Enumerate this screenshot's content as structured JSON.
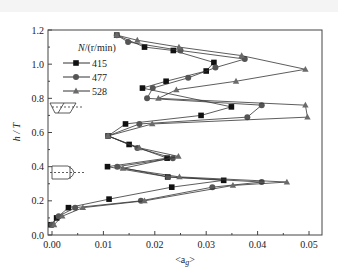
{
  "chart_data": {
    "type": "line",
    "title": "",
    "xlabel": "<a_g>",
    "ylabel": "h / T",
    "xlim": [
      0.0,
      0.0525
    ],
    "ylim": [
      0.0,
      1.2
    ],
    "xticks": [
      "0.00",
      "0.01",
      "0.02",
      "0.03",
      "0.04",
      "0.05"
    ],
    "yticks": [
      "0.0",
      "0.2",
      "0.4",
      "0.6",
      "0.8",
      "1.0",
      "1.2"
    ],
    "grid": false,
    "legend_title": "N/(r/min)",
    "legend_position": "upper left",
    "series": [
      {
        "name": "415",
        "marker": "square",
        "points": [
          [
            0.0126,
            1.17
          ],
          [
            0.018,
            1.1
          ],
          [
            0.0236,
            1.08
          ],
          [
            0.0315,
            1.01
          ],
          [
            0.03,
            0.96
          ],
          [
            0.0222,
            0.9
          ],
          [
            0.0176,
            0.86
          ],
          [
            0.0349,
            0.75
          ],
          [
            0.029,
            0.7
          ],
          [
            0.0143,
            0.65
          ],
          [
            0.0109,
            0.58
          ],
          [
            0.015,
            0.53
          ],
          [
            0.0224,
            0.45
          ],
          [
            0.0108,
            0.4
          ],
          [
            0.0225,
            0.34
          ],
          [
            0.0334,
            0.32
          ],
          [
            0.0233,
            0.28
          ],
          [
            0.0111,
            0.21
          ],
          [
            0.0032,
            0.16
          ],
          [
            0.0009,
            0.1
          ],
          [
            -0.0002,
            0.06
          ]
        ]
      },
      {
        "name": "477",
        "marker": "circle",
        "points": [
          [
            0.0126,
            1.17
          ],
          [
            0.0148,
            1.13
          ],
          [
            0.025,
            1.08
          ],
          [
            0.0375,
            1.03
          ],
          [
            0.0318,
            0.98
          ],
          [
            0.0265,
            0.92
          ],
          [
            0.0196,
            0.86
          ],
          [
            0.0185,
            0.8
          ],
          [
            0.0408,
            0.76
          ],
          [
            0.038,
            0.69
          ],
          [
            0.017,
            0.65
          ],
          [
            0.0109,
            0.58
          ],
          [
            0.0166,
            0.51
          ],
          [
            0.0235,
            0.45
          ],
          [
            0.0127,
            0.4
          ],
          [
            0.0226,
            0.34
          ],
          [
            0.0408,
            0.31
          ],
          [
            0.0312,
            0.28
          ],
          [
            0.0173,
            0.2
          ],
          [
            0.0045,
            0.16
          ],
          [
            0.0013,
            0.11
          ],
          [
            0.0,
            0.06
          ]
        ]
      },
      {
        "name": "528",
        "marker": "triangle",
        "points": [
          [
            0.0126,
            1.17
          ],
          [
            0.0166,
            1.14
          ],
          [
            0.0247,
            1.1
          ],
          [
            0.0369,
            1.05
          ],
          [
            0.0493,
            0.97
          ],
          [
            0.0358,
            0.9
          ],
          [
            0.0242,
            0.85
          ],
          [
            0.0207,
            0.8
          ],
          [
            0.0493,
            0.76
          ],
          [
            0.0497,
            0.69
          ],
          [
            0.0195,
            0.65
          ],
          [
            0.0109,
            0.58
          ],
          [
            0.017,
            0.51
          ],
          [
            0.0246,
            0.46
          ],
          [
            0.0138,
            0.39
          ],
          [
            0.0248,
            0.34
          ],
          [
            0.0457,
            0.31
          ],
          [
            0.0352,
            0.29
          ],
          [
            0.018,
            0.2
          ],
          [
            0.006,
            0.16
          ],
          [
            0.002,
            0.11
          ],
          [
            0.0004,
            0.06
          ]
        ]
      }
    ]
  },
  "axes": {
    "xlabel": "<a",
    "xlabel_sub": "g",
    "xlabel_end": ">",
    "ylabel": "h / T"
  },
  "legend": {
    "title": "N/(r/min)",
    "items": [
      "415",
      "477",
      "528"
    ]
  },
  "colors": {
    "axis": "#444444",
    "line": "#333333",
    "square": "#111111",
    "circle": "#555555",
    "triangle": "#6a6a6a"
  }
}
